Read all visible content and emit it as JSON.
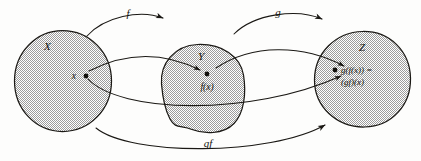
{
  "figure": {
    "kind": "function-composition-venn-diagram"
  },
  "colors": {
    "ink": "#1a1814",
    "fill_gray": "#c8c8c8",
    "background": "#fdfdfc"
  },
  "sets": [
    {
      "id": "X",
      "label": "X",
      "shape": "circle"
    },
    {
      "id": "Y",
      "label": "Y",
      "shape": "blob"
    },
    {
      "id": "Z",
      "label": "Z",
      "shape": "blob"
    }
  ],
  "points": [
    {
      "id": "x",
      "label": "x",
      "set": "X"
    },
    {
      "id": "fx",
      "label": "f(x)",
      "set": "Y"
    },
    {
      "id": "gfx",
      "label_line1": "g(f(x)) =",
      "label_line2": "(gf)(x)",
      "set": "Z"
    }
  ],
  "arrows": [
    {
      "id": "f",
      "label": "f",
      "from": "X",
      "to": "Y",
      "position": "top-left-arc"
    },
    {
      "id": "g",
      "label": "g",
      "from": "Y",
      "to": "Z",
      "position": "top-right-arc"
    },
    {
      "id": "gf",
      "label": "gf",
      "from": "X",
      "to": "Z",
      "position": "bottom-arc"
    }
  ],
  "element_maps": [
    {
      "id": "map-x-to-fx",
      "from_point": "x",
      "to_point": "fx",
      "style": "thin-curve-with-arrowhead"
    },
    {
      "id": "map-fx-to-gfx",
      "from_point": "fx",
      "to_point": "gfx",
      "style": "thin-curve-with-arrowhead"
    },
    {
      "id": "map-x-to-gfx",
      "from_point": "x",
      "to_point": "gfx",
      "style": "long-dipping-curve-with-arrowhead"
    }
  ]
}
